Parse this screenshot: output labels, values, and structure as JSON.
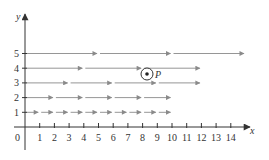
{
  "diagram": {
    "axes": {
      "x_label": "x",
      "y_label": "y",
      "origin_label": "0",
      "x_ticks": [
        "1",
        "2",
        "3",
        "4",
        "5",
        "6",
        "7",
        "8",
        "9",
        "10",
        "11",
        "12",
        "13",
        "14"
      ],
      "y_ticks": [
        "1",
        "2",
        "3",
        "4",
        "5"
      ]
    },
    "rows": [
      {
        "y": 1,
        "segment_length": 1,
        "count": 10
      },
      {
        "y": 2,
        "segment_length": 2,
        "count": 5
      },
      {
        "y": 3,
        "segment_length": 3,
        "count": 4
      },
      {
        "y": 4,
        "segment_length": 4,
        "count": 3
      },
      {
        "y": 5,
        "segment_length": 5,
        "count": 3
      }
    ],
    "point": {
      "label": "P",
      "x": 8.2,
      "y": 3.6,
      "symbol": "circled-dot"
    },
    "colors": {
      "axis": "#333333",
      "arrow": "#8a8a8a",
      "text": "#333333"
    }
  }
}
